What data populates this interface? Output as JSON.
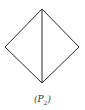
{
  "figure": {
    "stroke_color": "#2a2a2a",
    "vertices": {
      "top": [
        42,
        9
      ],
      "left": [
        5,
        47
      ],
      "right": [
        79,
        47
      ],
      "bottom": [
        42,
        83
      ]
    },
    "diagonal": "top-to-bottom"
  },
  "caption": {
    "open": "(",
    "letter": "P",
    "subscript": "2",
    "close": ")"
  }
}
